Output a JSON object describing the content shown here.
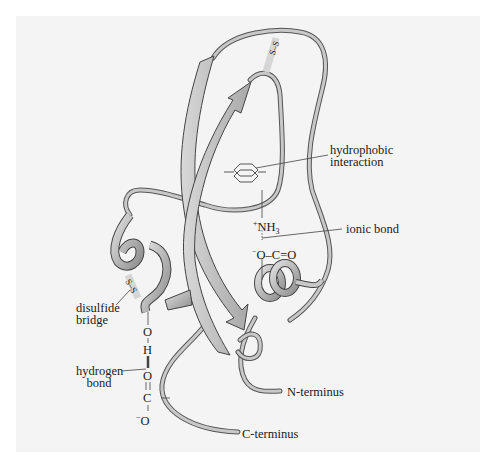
{
  "figure": {
    "background": "#f4f4f4",
    "ribbon_color": "#b8b8b8",
    "outline_color": "#555555"
  },
  "labels": {
    "hydrophobic": {
      "line1": "hydrophobic",
      "line2": "interaction"
    },
    "ionic": "ionic bond",
    "disulfide": {
      "line1": "disulfide",
      "line2": "bridge"
    },
    "hydrogen": {
      "line1": "hydrogen",
      "line2": "bond"
    },
    "n_terminus": "N-terminus",
    "c_terminus": "C-terminus"
  },
  "chemistry": {
    "nh3_charge": "+",
    "nh3": "NH",
    "nh3_sub": "3",
    "carboxylate_charge": "−",
    "carboxylate": "O–C=O",
    "o_top": "O",
    "h": "H",
    "o_mid": "O",
    "c": "C",
    "o_bottom_charge": "−",
    "o_bottom": "O",
    "ss_top": "S–S",
    "ss_left": "S–S"
  }
}
